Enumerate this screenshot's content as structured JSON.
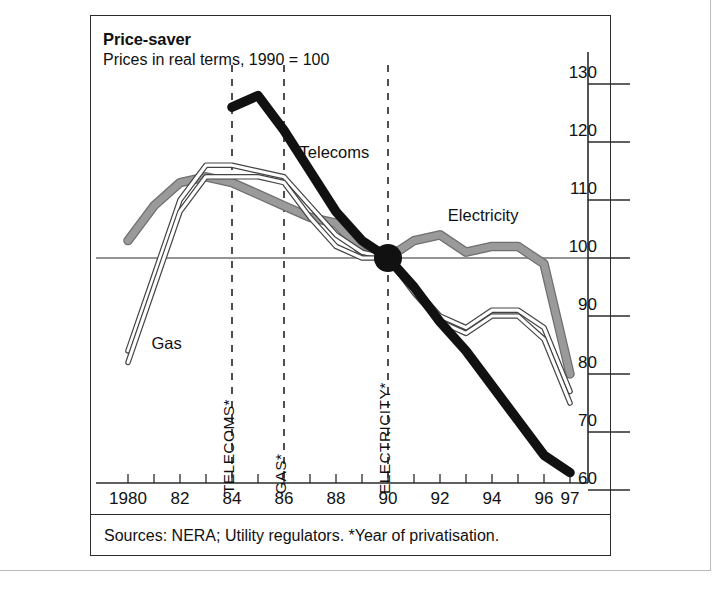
{
  "card": {
    "title": "Price-saver",
    "subtitle": "Prices in real terms, 1990 = 100",
    "source": "Sources: NERA; Utility regulators.  *Year of privatisation."
  },
  "colors": {
    "telecoms": "#111111",
    "electricity": "#9a9a9a",
    "gas": "#ffffff",
    "gas_stroke": "#444444",
    "axis": "#2b2b2b",
    "marker": "#111111",
    "event_line": "#3b3b3b"
  },
  "annotations": [
    {
      "name": "telecoms-privatisation",
      "label": "TELECOMS*",
      "year": 1984
    },
    {
      "name": "gas-privatisation",
      "label": "GAS*",
      "year": 1986
    },
    {
      "name": "electricity-privatisation",
      "label": "ELECTRICITY*",
      "year": 1990
    }
  ],
  "marker": {
    "label": "",
    "year": 1990,
    "value": 100
  },
  "chart_data": {
    "type": "line",
    "title": "Price-saver",
    "subtitle": "Prices in real terms, 1990 = 100",
    "xlabel": "",
    "ylabel": "",
    "xlim": [
      1980,
      1997
    ],
    "ylim": [
      58,
      133
    ],
    "yticks": [
      130,
      120,
      110,
      100,
      90,
      80,
      70,
      60
    ],
    "xticks": [
      1980,
      1981,
      1982,
      1983,
      1984,
      1985,
      1986,
      1987,
      1988,
      1989,
      1990,
      1991,
      1992,
      1993,
      1994,
      1995,
      1996,
      1997
    ],
    "xticklabels": [
      "1980",
      "",
      "82",
      "",
      "84",
      "",
      "86",
      "",
      "88",
      "",
      "90",
      "",
      "92",
      "",
      "94",
      "",
      "96",
      "97"
    ],
    "grid": false,
    "baseline": 100,
    "legend": "inline-labels",
    "series": [
      {
        "name": "Telecoms",
        "style": "thick-black",
        "x": [
          1984,
          1985,
          1986,
          1987,
          1988,
          1989,
          1990,
          1991,
          1992,
          1993,
          1994,
          1995,
          1996,
          1997
        ],
        "values": [
          126,
          128,
          122,
          115,
          108,
          103,
          100,
          95,
          89,
          84,
          78,
          72,
          66,
          63
        ]
      },
      {
        "name": "Electricity",
        "style": "thick-grey",
        "x": [
          1980,
          1981,
          1982,
          1983,
          1984,
          1985,
          1986,
          1987,
          1988,
          1989,
          1990,
          1991,
          1992,
          1993,
          1994,
          1995,
          1996,
          1997
        ],
        "values": [
          103,
          109,
          113,
          114,
          113,
          111,
          109,
          107,
          106,
          101,
          100,
          103,
          104,
          101,
          102,
          102,
          99,
          80
        ]
      },
      {
        "name": "Gas",
        "style": "thin-white-outline",
        "x": [
          1980,
          1981,
          1982,
          1983,
          1984,
          1985,
          1986,
          1987,
          1988,
          1989,
          1990,
          1991,
          1992,
          1993,
          1994,
          1995,
          1996,
          1997
        ],
        "values": [
          84,
          97,
          110,
          116,
          116,
          115,
          114,
          109,
          104,
          101,
          100,
          95,
          90,
          88,
          91,
          91,
          88,
          77
        ]
      },
      {
        "name": "Gas-inner",
        "style": "thin-white-outline",
        "x": [
          1980,
          1981,
          1982,
          1983,
          1984,
          1985,
          1986,
          1987,
          1988,
          1989,
          1990,
          1991,
          1992,
          1993,
          1994,
          1995,
          1996,
          1997
        ],
        "values": [
          82,
          95,
          108,
          114,
          114,
          114,
          113,
          107,
          102,
          100,
          100,
          94,
          89,
          87,
          90,
          90,
          86,
          75
        ]
      }
    ],
    "series_labels": [
      {
        "name": "Telecoms",
        "year": 1986.6,
        "value": 118
      },
      {
        "name": "Electricity",
        "year": 1992.3,
        "value": 107
      },
      {
        "name": "Gas",
        "year": 1980.9,
        "value": 85
      }
    ]
  }
}
